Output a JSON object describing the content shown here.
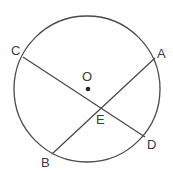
{
  "diagram": {
    "type": "geometry-circle-chords",
    "colors": {
      "stroke": "#4a4a4a",
      "text": "#3a3a3a",
      "background": "#ffffff"
    },
    "circle": {
      "center_label": "O",
      "cx": 87,
      "cy": 89,
      "r": 73
    },
    "points": {
      "A": {
        "label": "A",
        "x": 155,
        "y": 58
      },
      "B": {
        "label": "B",
        "x": 52,
        "y": 154
      },
      "C": {
        "label": "C",
        "x": 23,
        "y": 57
      },
      "D": {
        "label": "D",
        "x": 145,
        "y": 137
      },
      "E": {
        "label": "E",
        "x": 101,
        "y": 109
      },
      "O": {
        "label": "O",
        "x": 88,
        "y": 89
      }
    },
    "chords": [
      {
        "from": "C",
        "to": "D"
      },
      {
        "from": "A",
        "to": "B"
      }
    ],
    "intersection": "E"
  }
}
